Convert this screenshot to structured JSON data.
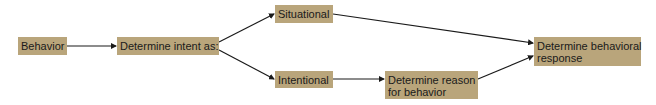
{
  "diagram": {
    "type": "flowchart",
    "nodes": [
      {
        "id": "behavior",
        "label": "Behavior"
      },
      {
        "id": "intent",
        "label": "Determine intent as:"
      },
      {
        "id": "situational",
        "label": "Situational"
      },
      {
        "id": "intentional",
        "label": "Intentional"
      },
      {
        "id": "reason",
        "label_line1": "Determine reason",
        "label_line2": "for behavior"
      },
      {
        "id": "response",
        "label_line1": "Determine behavioral",
        "label_line2": "response"
      }
    ],
    "edges": [
      {
        "from": "behavior",
        "to": "intent"
      },
      {
        "from": "intent",
        "to": "situational"
      },
      {
        "from": "intent",
        "to": "intentional"
      },
      {
        "from": "situational",
        "to": "response"
      },
      {
        "from": "intentional",
        "to": "reason"
      },
      {
        "from": "reason",
        "to": "response"
      }
    ],
    "colors": {
      "node_fill": "#b9a57b",
      "text": "#1a1a1a",
      "edge": "#1a1a1a"
    }
  }
}
